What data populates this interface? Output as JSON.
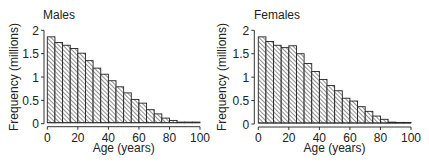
{
  "chart_data": [
    {
      "type": "bar",
      "title": "Males",
      "xlabel": "Age (years)",
      "ylabel": "Frequency (millions)",
      "x_ticks": [
        0,
        20,
        40,
        60,
        80,
        100
      ],
      "y_ticks": [
        0,
        0.5,
        1,
        1.5,
        2
      ],
      "y_tick_labels": [
        "0",
        "0.5",
        "1",
        "1.5",
        "2"
      ],
      "xlim": [
        0,
        100
      ],
      "ylim": [
        0,
        2
      ],
      "bin_width": 5,
      "categories": [
        "0-5",
        "5-10",
        "10-15",
        "15-20",
        "20-25",
        "25-30",
        "30-35",
        "35-40",
        "40-45",
        "45-50",
        "50-55",
        "55-60",
        "60-65",
        "65-70",
        "70-75",
        "75-80",
        "80-85",
        "85-90",
        "90-95",
        "95-100"
      ],
      "bin_starts": [
        0,
        5,
        10,
        15,
        20,
        25,
        30,
        35,
        40,
        45,
        50,
        55,
        60,
        65,
        70,
        75,
        80,
        85,
        90,
        95
      ],
      "values": [
        1.86,
        1.74,
        1.68,
        1.61,
        1.51,
        1.35,
        1.19,
        1.06,
        0.92,
        0.79,
        0.66,
        0.52,
        0.44,
        0.3,
        0.21,
        0.12,
        0.07,
        0.03,
        0.01,
        0.0
      ],
      "grid": false,
      "legend": null,
      "fill": "hatched"
    },
    {
      "type": "bar",
      "title": "Females",
      "xlabel": "Age (years)",
      "ylabel": "Frequency (millions)",
      "x_ticks": [
        0,
        20,
        40,
        60,
        80,
        100
      ],
      "y_ticks": [
        0,
        0.5,
        1,
        1.5,
        2
      ],
      "y_tick_labels": [
        "0",
        "0.5",
        "1",
        "1.5",
        "2"
      ],
      "xlim": [
        0,
        100
      ],
      "ylim": [
        0,
        2
      ],
      "bin_width": 5,
      "categories": [
        "0-5",
        "5-10",
        "10-15",
        "15-20",
        "20-25",
        "25-30",
        "30-35",
        "35-40",
        "40-45",
        "45-50",
        "50-55",
        "55-60",
        "60-65",
        "65-70",
        "70-75",
        "75-80",
        "80-85",
        "85-90",
        "90-95",
        "95-100"
      ],
      "bin_starts": [
        0,
        5,
        10,
        15,
        20,
        25,
        30,
        35,
        40,
        45,
        50,
        55,
        60,
        65,
        70,
        75,
        80,
        85,
        90,
        95
      ],
      "values": [
        1.86,
        1.76,
        1.68,
        1.63,
        1.67,
        1.5,
        1.29,
        1.12,
        0.95,
        0.82,
        0.71,
        0.55,
        0.49,
        0.37,
        0.27,
        0.17,
        0.1,
        0.04,
        0.01,
        0.0
      ],
      "grid": false,
      "legend": null,
      "fill": "hatched"
    }
  ],
  "panels": {
    "males": {
      "title": "Males",
      "xlabel": "Age (years)",
      "ylabel": "Frequency (millions)"
    },
    "females": {
      "title": "Females",
      "xlabel": "Age (years)",
      "ylabel": "Frequency (millions)"
    }
  },
  "style": {
    "bar_stroke": "#222222",
    "hatch_color": "#333333",
    "axis_color": "#333333",
    "background": "#ffffff"
  }
}
